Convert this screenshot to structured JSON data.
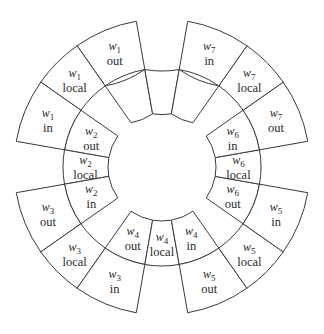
{
  "diagram": {
    "title": "",
    "center": [
      162,
      167
    ],
    "radii": {
      "hole": 54,
      "inner_ring_outer": 99,
      "outer_ring_outer": 148
    },
    "colors": {
      "stroke": "#3a3a3a",
      "fill": "#ffffff",
      "text": "#2a2a2a"
    },
    "cells": [
      {
        "id": "w0-in",
        "var": "w",
        "sub": "0",
        "kind": "in",
        "ring": "inner",
        "a0": 100,
        "a1": 125
      },
      {
        "id": "w0-local",
        "var": "w",
        "sub": "0",
        "kind": "local",
        "ring": "inner",
        "a0": 80,
        "a1": 100
      },
      {
        "id": "w0-out",
        "var": "w",
        "sub": "0",
        "kind": "out",
        "ring": "inner",
        "a0": 55,
        "a1": 80
      },
      {
        "id": "w2-out",
        "var": "w",
        "sub": "2",
        "kind": "out",
        "ring": "inner",
        "a0": 170,
        "a1": 145
      },
      {
        "id": "w2-local",
        "var": "w",
        "sub": "2",
        "kind": "local",
        "ring": "inner",
        "a0": 190,
        "a1": 170
      },
      {
        "id": "w2-in",
        "var": "w",
        "sub": "2",
        "kind": "in",
        "ring": "inner",
        "a0": 215,
        "a1": 190
      },
      {
        "id": "w4-out",
        "var": "w",
        "sub": "4",
        "kind": "out",
        "ring": "inner",
        "a0": 260,
        "a1": 235
      },
      {
        "id": "w4-local",
        "var": "w",
        "sub": "4",
        "kind": "local",
        "ring": "inner",
        "a0": 280,
        "a1": 260
      },
      {
        "id": "w4-in",
        "var": "w",
        "sub": "4",
        "kind": "in",
        "ring": "inner",
        "a0": 305,
        "a1": 280
      },
      {
        "id": "w6-out",
        "var": "w",
        "sub": "6",
        "kind": "out",
        "ring": "inner",
        "a0": 350,
        "a1": 325
      },
      {
        "id": "w6-local",
        "var": "w",
        "sub": "6",
        "kind": "local",
        "ring": "inner",
        "a0": 10,
        "a1": -10
      },
      {
        "id": "w6-in",
        "var": "w",
        "sub": "6",
        "kind": "in",
        "ring": "inner",
        "a0": 35,
        "a1": 10
      },
      {
        "id": "w1-out",
        "var": "w",
        "sub": "1",
        "kind": "out",
        "ring": "outer",
        "a0": 125,
        "a1": 100
      },
      {
        "id": "w1-local",
        "var": "w",
        "sub": "1",
        "kind": "local",
        "ring": "outer",
        "a0": 145,
        "a1": 125
      },
      {
        "id": "w1-in",
        "var": "w",
        "sub": "1",
        "kind": "in",
        "ring": "outer",
        "a0": 170,
        "a1": 145
      },
      {
        "id": "w3-out",
        "var": "w",
        "sub": "3",
        "kind": "out",
        "ring": "outer",
        "a0": 215,
        "a1": 190
      },
      {
        "id": "w3-local",
        "var": "w",
        "sub": "3",
        "kind": "local",
        "ring": "outer",
        "a0": 235,
        "a1": 215
      },
      {
        "id": "w3-in",
        "var": "w",
        "sub": "3",
        "kind": "in",
        "ring": "outer",
        "a0": 260,
        "a1": 235
      },
      {
        "id": "w5-out",
        "var": "w",
        "sub": "5",
        "kind": "out",
        "ring": "outer",
        "a0": 305,
        "a1": 280
      },
      {
        "id": "w5-local",
        "var": "w",
        "sub": "5",
        "kind": "local",
        "ring": "outer",
        "a0": 325,
        "a1": 305
      },
      {
        "id": "w5-in",
        "var": "w",
        "sub": "5",
        "kind": "in",
        "ring": "outer",
        "a0": 350,
        "a1": 325
      },
      {
        "id": "w7-out",
        "var": "w",
        "sub": "7",
        "kind": "out",
        "ring": "outer",
        "a0": 35,
        "a1": 10
      },
      {
        "id": "w7-local",
        "var": "w",
        "sub": "7",
        "kind": "local",
        "ring": "outer",
        "a0": 55,
        "a1": 35
      },
      {
        "id": "w7-in",
        "var": "w",
        "sub": "7",
        "kind": "in",
        "ring": "outer",
        "a0": 80,
        "a1": 55
      }
    ]
  }
}
